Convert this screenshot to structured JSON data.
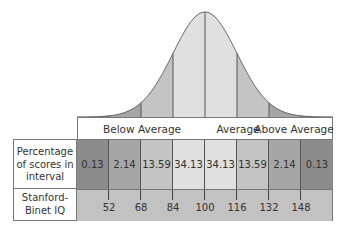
{
  "chart_data": {
    "type": "area",
    "title": "",
    "groups": [
      "Below Average",
      "Average",
      "Above Average"
    ],
    "row_labels": [
      "Percentage of scores in interval",
      "Stanford-Binet IQ"
    ],
    "intervals": [
      {
        "percent": 0.13,
        "color": "#8c8c8c"
      },
      {
        "percent": 2.14,
        "color": "#a6a6a6"
      },
      {
        "percent": 13.59,
        "color": "#c4c4c4"
      },
      {
        "percent": 34.13,
        "color": "#e0e0e0"
      },
      {
        "percent": 34.13,
        "color": "#e0e0e0"
      },
      {
        "percent": 13.59,
        "color": "#c4c4c4"
      },
      {
        "percent": 2.14,
        "color": "#a6a6a6"
      },
      {
        "percent": 0.13,
        "color": "#8c8c8c"
      }
    ],
    "percentages": [
      "0.13",
      "2.14",
      "13.59",
      "34.13",
      "34.13",
      "13.59",
      "2.14",
      "0.13"
    ],
    "iq_ticks": [
      "52",
      "68",
      "84",
      "100",
      "116",
      "132",
      "148"
    ],
    "mean": 100,
    "sd": 16
  },
  "header": {
    "below": "Below Average",
    "average": "Average",
    "above": "Above Average"
  },
  "labels": {
    "percent_l1": "Percentage",
    "percent_l2": "of scores in",
    "percent_l3": "interval",
    "iq_l1": "Stanford-",
    "iq_l2": "Binet IQ"
  },
  "colors": {
    "outer": "#8c8c8c",
    "second": "#a6a6a6",
    "third": "#c4c4c4",
    "center": "#e0e0e0",
    "iq_row": "#c2c2c2"
  }
}
